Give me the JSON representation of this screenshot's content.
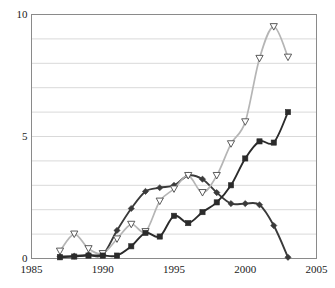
{
  "chart_data": {
    "type": "line",
    "title": "",
    "xlabel": "",
    "ylabel": "",
    "xlim": [
      1985,
      2005
    ],
    "ylim": [
      0,
      10
    ],
    "x_ticks": [
      1985,
      1990,
      1995,
      2000,
      2005
    ],
    "y_ticks": [
      0,
      5,
      10
    ],
    "gridlines": {
      "horizontal": [
        1,
        2,
        3,
        4,
        5,
        6,
        7,
        8,
        9
      ],
      "vertical": []
    },
    "grid": true,
    "legend": "none",
    "x": [
      1987,
      1988,
      1989,
      1990,
      1991,
      1992,
      1993,
      1994,
      1995,
      1996,
      1997,
      1998,
      1999,
      2000,
      2001,
      2002,
      2003
    ],
    "series": [
      {
        "name": "series-diamond",
        "marker": "diamond",
        "color": "#3a3a3a",
        "values": [
          0.08,
          0.1,
          0.15,
          0.15,
          1.15,
          2.05,
          2.75,
          2.9,
          3.0,
          3.4,
          3.25,
          2.7,
          2.25,
          2.25,
          2.2,
          1.35,
          0.05
        ]
      },
      {
        "name": "series-triangle",
        "marker": "triangle-down",
        "color": "#b5b5b5",
        "values": [
          0.3,
          1.0,
          0.4,
          0.2,
          0.8,
          1.4,
          1.1,
          2.35,
          2.85,
          3.4,
          2.7,
          3.4,
          4.7,
          5.6,
          8.2,
          9.5,
          8.25
        ]
      },
      {
        "name": "series-square",
        "marker": "square",
        "color": "#2b2b2b",
        "values": [
          0.05,
          0.08,
          0.12,
          0.12,
          0.12,
          0.5,
          1.05,
          0.9,
          1.75,
          1.45,
          1.9,
          2.3,
          3.0,
          4.1,
          4.8,
          4.75,
          6.0
        ]
      }
    ]
  },
  "axis": {
    "y_tick_labels": [
      "0",
      "5",
      "10"
    ],
    "x_tick_labels": [
      "1985",
      "1990",
      "1995",
      "2000",
      "2005"
    ]
  },
  "colors": {
    "plot_border": "#8a8a8a",
    "gridline": "#d9d9d9",
    "background": "#ffffff",
    "dark_series": "#3a3a3a",
    "gray_series": "#b5b5b5",
    "square_series": "#2b2b2b",
    "text": "#1a1a1a"
  }
}
